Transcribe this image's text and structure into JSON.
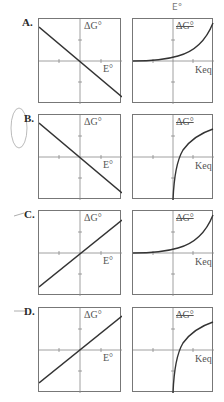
{
  "annotation": {
    "handwritten_top": "E°"
  },
  "options": [
    {
      "label": "A.",
      "left": {
        "y_label": "ΔG°",
        "x_label": "E°",
        "curve": "line-decreasing"
      },
      "right": {
        "y_label": "ΔG°",
        "x_label": "Keq",
        "curve": "exponential-increasing",
        "y_label_struck": true
      }
    },
    {
      "label": "B.",
      "left": {
        "y_label": "ΔG°",
        "x_label": "E°",
        "curve": "line-decreasing"
      },
      "right": {
        "y_label": "ΔG°",
        "x_label": "Keq",
        "curve": "logarithmic",
        "y_label_struck": true
      }
    },
    {
      "label": "C.",
      "left": {
        "y_label": "ΔG°",
        "x_label": "E°",
        "curve": "line-increasing"
      },
      "right": {
        "y_label": "ΔG°",
        "x_label": "Keq",
        "curve": "exponential-increasing",
        "y_label_struck": true
      }
    },
    {
      "label": "D.",
      "left": {
        "y_label": "ΔG°",
        "x_label": "E°",
        "curve": "line-increasing"
      },
      "right": {
        "y_label": "ΔG°",
        "x_label": "Keq",
        "curve": "logarithmic",
        "y_label_struck": true
      }
    }
  ],
  "colors": {
    "frame": "#777777",
    "curve": "#333333",
    "axis": "#888888"
  }
}
